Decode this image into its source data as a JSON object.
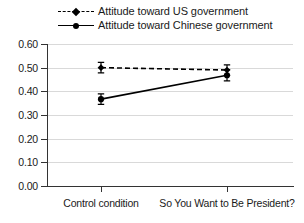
{
  "chart_data": {
    "type": "line",
    "title": "",
    "xlabel": "",
    "ylabel": "",
    "categories": [
      "Control condition",
      "So You Want to Be President?"
    ],
    "ylim": [
      0.0,
      0.6
    ],
    "yticks": [
      "0.00",
      "0.10",
      "0.20",
      "0.30",
      "0.40",
      "0.50",
      "0.60"
    ],
    "ytick_values": [
      0.0,
      0.1,
      0.2,
      0.3,
      0.4,
      0.5,
      0.6
    ],
    "grid": true,
    "legend_position": "top",
    "series": [
      {
        "name": "Attitude toward US government",
        "values": [
          0.5,
          0.49
        ],
        "errors": [
          0.022,
          0.022
        ],
        "line_style": "dashed",
        "marker": "diamond",
        "color": "#000000"
      },
      {
        "name": "Attitude toward Chinese government",
        "values": [
          0.367,
          0.468
        ],
        "errors": [
          0.022,
          0.024
        ],
        "line_style": "solid",
        "marker": "circle",
        "color": "#000000"
      }
    ]
  },
  "legend": {
    "items": [
      {
        "label": "Attitude toward US government"
      },
      {
        "label": "Attitude toward Chinese government"
      }
    ]
  },
  "axes": {
    "y_tick_labels": [
      "0.60",
      "0.50",
      "0.40",
      "0.30",
      "0.20",
      "0.10",
      "0.00"
    ],
    "x_tick_labels": [
      "Control condition",
      "So You Want to Be President?"
    ]
  },
  "colors": {
    "line": "#000000",
    "grid": "#d9d9d9",
    "axis": "#333333",
    "background": "#ffffff",
    "text": "#1a1a1a"
  }
}
